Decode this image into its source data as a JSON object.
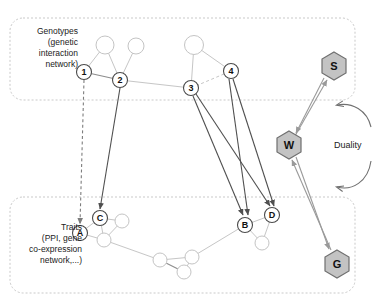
{
  "figure": {
    "width": 382,
    "height": 301,
    "background": "#ffffff"
  },
  "panels": {
    "genotypes": {
      "caption": "Genotypes\n(genetic\ninteraction\nnetwork)",
      "border_color": "#c9c9c9"
    },
    "traits": {
      "caption": "Traits\n(PPI, gene\nco-expression\nnetwork,...)",
      "border_color": "#c9c9c9"
    }
  },
  "genotype_nodes": [
    {
      "id": "g1",
      "label": "1",
      "x": 84,
      "y": 72,
      "r": 7.5,
      "labeled": true
    },
    {
      "id": "g2",
      "label": "2",
      "x": 120,
      "y": 80,
      "r": 7.5,
      "labeled": true
    },
    {
      "id": "g3",
      "label": "3",
      "x": 191,
      "y": 88,
      "r": 7.5,
      "labeled": true
    },
    {
      "id": "g4",
      "label": "4",
      "x": 231,
      "y": 71,
      "r": 7.5,
      "labeled": true
    },
    {
      "id": "gu1",
      "label": "",
      "x": 105,
      "y": 45,
      "r": 9,
      "labeled": false
    },
    {
      "id": "gu2",
      "label": "",
      "x": 136,
      "y": 46,
      "r": 8,
      "labeled": false
    },
    {
      "id": "gu3",
      "label": "",
      "x": 194,
      "y": 45,
      "r": 9.5,
      "labeled": false
    }
  ],
  "genotype_edges": [
    {
      "from": "g1",
      "to": "gu1",
      "style": "light"
    },
    {
      "from": "gu1",
      "to": "g2",
      "style": "light"
    },
    {
      "from": "gu2",
      "to": "g2",
      "style": "light"
    },
    {
      "from": "g1",
      "to": "g2",
      "style": "dark"
    },
    {
      "from": "g2",
      "to": "g3",
      "style": "light"
    },
    {
      "from": "gu3",
      "to": "g3",
      "style": "light"
    },
    {
      "from": "gu3",
      "to": "g4",
      "style": "light"
    },
    {
      "from": "g3",
      "to": "g4",
      "style": "dashed-light"
    }
  ],
  "trait_nodes": [
    {
      "id": "tA",
      "label": "A",
      "x": 80,
      "y": 233,
      "r": 7.5,
      "labeled": true
    },
    {
      "id": "tC",
      "label": "C",
      "x": 100,
      "y": 218,
      "r": 7.5,
      "labeled": true
    },
    {
      "id": "tB",
      "label": "B",
      "x": 245,
      "y": 225,
      "r": 7.5,
      "labeled": true
    },
    {
      "id": "tD",
      "label": "D",
      "x": 272,
      "y": 215,
      "r": 7.5,
      "labeled": true
    },
    {
      "id": "tu1",
      "label": "",
      "x": 122,
      "y": 221,
      "r": 7,
      "labeled": false
    },
    {
      "id": "tu2",
      "label": "",
      "x": 104,
      "y": 240,
      "r": 7,
      "labeled": false
    },
    {
      "id": "tu3",
      "label": "",
      "x": 160,
      "y": 260,
      "r": 7,
      "labeled": false
    },
    {
      "id": "tu4",
      "label": "",
      "x": 184,
      "y": 272,
      "r": 7,
      "labeled": false
    },
    {
      "id": "tu5",
      "label": "",
      "x": 192,
      "y": 257,
      "r": 7,
      "labeled": false
    },
    {
      "id": "tu6",
      "label": "",
      "x": 262,
      "y": 243,
      "r": 7,
      "labeled": false
    }
  ],
  "trait_edges": [
    {
      "from": "tA",
      "to": "tC",
      "style": "light"
    },
    {
      "from": "tC",
      "to": "tu1",
      "style": "light"
    },
    {
      "from": "tC",
      "to": "tu2",
      "style": "light"
    },
    {
      "from": "tu1",
      "to": "tu2",
      "style": "light"
    },
    {
      "from": "tA",
      "to": "tu2",
      "style": "light"
    },
    {
      "from": "tu2",
      "to": "tu3",
      "style": "light"
    },
    {
      "from": "tu3",
      "to": "tu4",
      "style": "dark"
    },
    {
      "from": "tu3",
      "to": "tu5",
      "style": "light"
    },
    {
      "from": "tu4",
      "to": "tu5",
      "style": "light"
    },
    {
      "from": "tu5",
      "to": "tB",
      "style": "light"
    },
    {
      "from": "tB",
      "to": "tu6",
      "style": "light"
    },
    {
      "from": "tD",
      "to": "tu6",
      "style": "light"
    },
    {
      "from": "tB",
      "to": "tD",
      "style": "light"
    }
  ],
  "causal_links": [
    {
      "from": "g1",
      "to": "tA",
      "style": "dashed"
    },
    {
      "from": "g2",
      "to": "tC",
      "style": "solid"
    },
    {
      "from": "g3",
      "to": "tB",
      "style": "solid"
    },
    {
      "from": "g3",
      "to": "tD",
      "style": "solid"
    },
    {
      "from": "g4",
      "to": "tB",
      "style": "solid"
    },
    {
      "from": "g4",
      "to": "tD",
      "style": "solid"
    }
  ],
  "hexagons": [
    {
      "id": "hS",
      "label": "S",
      "x": 334,
      "y": 66,
      "r": 14,
      "fill": "#c3c3c3"
    },
    {
      "id": "hW",
      "label": "W",
      "x": 289,
      "y": 145,
      "r": 14,
      "fill": "#c3c3c3"
    },
    {
      "id": "hG",
      "label": "G",
      "x": 337,
      "y": 264,
      "r": 14,
      "fill": "#c3c3c3"
    }
  ],
  "duality": {
    "label": "Duality",
    "arrow_color": "#9a9a9a"
  },
  "colors": {
    "panel_border": "#c9c9c9",
    "light_edge": "#c6c6c6",
    "dark_edge": "#4f4f4f",
    "hex_fill": "#c3c3c3",
    "hex_stroke": "#6f6f6f",
    "text": "#222222"
  }
}
